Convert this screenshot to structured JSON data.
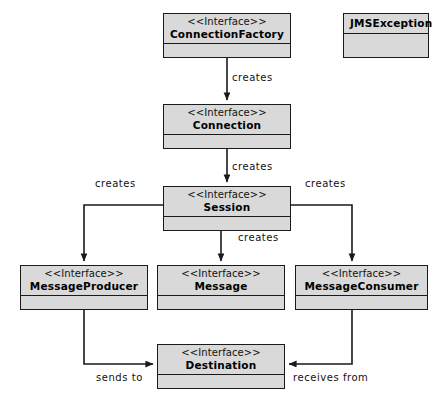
{
  "diagram": {
    "stereotype_text": "<<Interface>>",
    "colors": {
      "box_fill": "#d9d9d9",
      "box_border": "#1a1a1a",
      "edge_stroke": "#1a1a1a",
      "background": "#ffffff",
      "text": "#000000"
    }
  },
  "nodes": [
    {
      "id": "connection-factory",
      "stereotype": "<<Interface>>",
      "name": "ConnectionFactory",
      "x": 163,
      "y": 13,
      "w": 128,
      "h": 45,
      "has_stereotype": true
    },
    {
      "id": "jms-exception",
      "stereotype": "",
      "name": "JMSException",
      "x": 343,
      "y": 13,
      "w": 86,
      "h": 45,
      "has_stereotype": false
    },
    {
      "id": "connection",
      "stereotype": "<<Interface>>",
      "name": "Connection",
      "x": 163,
      "y": 104,
      "w": 128,
      "h": 45,
      "has_stereotype": true
    },
    {
      "id": "session",
      "stereotype": "<<Interface>>",
      "name": "Session",
      "x": 163,
      "y": 186,
      "w": 128,
      "h": 45,
      "has_stereotype": true
    },
    {
      "id": "message-producer",
      "stereotype": "<<Interface>>",
      "name": "MessageProducer",
      "x": 20,
      "y": 265,
      "w": 128,
      "h": 45,
      "has_stereotype": true
    },
    {
      "id": "message",
      "stereotype": "<<Interface>>",
      "name": "Message",
      "x": 157,
      "y": 265,
      "w": 128,
      "h": 45,
      "has_stereotype": true
    },
    {
      "id": "message-consumer",
      "stereotype": "<<Interface>>",
      "name": "MessageConsumer",
      "x": 295,
      "y": 265,
      "w": 133,
      "h": 45,
      "has_stereotype": true
    },
    {
      "id": "destination",
      "stereotype": "<<Interface>>",
      "name": "Destination",
      "x": 157,
      "y": 344,
      "w": 128,
      "h": 45,
      "has_stereotype": true
    }
  ],
  "edges": [
    {
      "id": "factory-creates-connection",
      "label": "creates",
      "from": "connection-factory",
      "to": "connection",
      "label_x": 232,
      "label_y": 72,
      "path": "M 227 58 L 227 100"
    },
    {
      "id": "connection-creates-session",
      "label": "creates",
      "from": "connection",
      "to": "session",
      "label_x": 232,
      "label_y": 161,
      "path": "M 227 149 L 227 182"
    },
    {
      "id": "session-creates-producer",
      "label": "creates",
      "from": "session",
      "to": "message-producer",
      "label_x": 95,
      "label_y": 178,
      "path": "M 163 205 L 84 205 L 84 261"
    },
    {
      "id": "session-creates-message",
      "label": "creates",
      "from": "session",
      "to": "message",
      "label_x": 238,
      "label_y": 232,
      "path": "M 221 231 L 221 261"
    },
    {
      "id": "session-creates-consumer",
      "label": "creates",
      "from": "session",
      "to": "message-consumer",
      "label_x": 305,
      "label_y": 178,
      "path": "M 291 205 L 352 205 L 352 261"
    },
    {
      "id": "producer-sends-to-destination",
      "label": "sends to",
      "from": "message-producer",
      "to": "destination",
      "label_x": 96,
      "label_y": 372,
      "path": "M 84 310 L 84 364 L 153 364"
    },
    {
      "id": "consumer-receives-from-destination",
      "label": "receives from",
      "from": "message-consumer",
      "to": "destination",
      "label_x": 293,
      "label_y": 372,
      "path": "M 352 310 L 352 364 L 289 364"
    }
  ]
}
